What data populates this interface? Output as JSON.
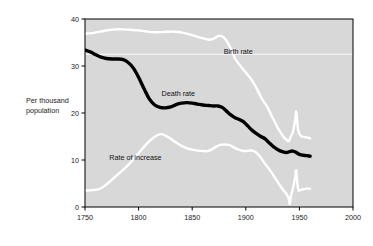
{
  "chart_data": {
    "type": "line",
    "title": "",
    "xlabel": "",
    "ylabel": "Per thousand population",
    "ylabel_line1": "Per thousand",
    "ylabel_line2": "population",
    "xlim": [
      1750,
      2000
    ],
    "ylim": [
      0,
      40
    ],
    "xticks": [
      1750,
      1800,
      1850,
      1900,
      1950,
      2000
    ],
    "yticks": [
      0,
      10,
      20,
      30,
      40
    ],
    "xtick_labels": [
      "1750",
      "1800",
      "1850",
      "1900",
      "1950",
      "2000"
    ],
    "ytick_labels": [
      "0",
      "10",
      "20",
      "30",
      "40"
    ],
    "grid": false,
    "gridlines_y": [
      32.5
    ],
    "legend_position": "inline-annotations",
    "plot_background": "#d8d8d8",
    "series": [
      {
        "name": "Birth rate",
        "color": "#ffffff",
        "label_x": 1893,
        "label_y": 32.6,
        "points": [
          [
            1750,
            36.9
          ],
          [
            1757,
            37.0
          ],
          [
            1764,
            37.3
          ],
          [
            1771,
            37.6
          ],
          [
            1778,
            37.8
          ],
          [
            1785,
            37.8
          ],
          [
            1792,
            37.7
          ],
          [
            1799,
            37.6
          ],
          [
            1806,
            37.4
          ],
          [
            1813,
            37.2
          ],
          [
            1820,
            37.2
          ],
          [
            1827,
            37.3
          ],
          [
            1834,
            37.3
          ],
          [
            1841,
            37.1
          ],
          [
            1848,
            36.7
          ],
          [
            1855,
            36.2
          ],
          [
            1862,
            35.8
          ],
          [
            1866,
            35.6
          ],
          [
            1869,
            35.7
          ],
          [
            1872,
            36.1
          ],
          [
            1875,
            36.4
          ],
          [
            1878,
            36.3
          ],
          [
            1881,
            35.7
          ],
          [
            1884,
            34.6
          ],
          [
            1887,
            33.2
          ],
          [
            1890,
            31.6
          ],
          [
            1895,
            30.0
          ],
          [
            1900,
            28.6
          ],
          [
            1905,
            27.2
          ],
          [
            1910,
            25.3
          ],
          [
            1915,
            23.0
          ],
          [
            1920,
            21.3
          ],
          [
            1925,
            19.0
          ],
          [
            1930,
            16.8
          ],
          [
            1935,
            15.0
          ],
          [
            1938,
            14.3
          ],
          [
            1940,
            14.0
          ],
          [
            1942,
            15.0
          ],
          [
            1944,
            16.0
          ],
          [
            1946,
            18.5
          ],
          [
            1947,
            20.3
          ],
          [
            1948,
            18.0
          ],
          [
            1949,
            16.2
          ],
          [
            1951,
            15.2
          ],
          [
            1954,
            14.9
          ],
          [
            1957,
            14.8
          ],
          [
            1960,
            14.6
          ]
        ]
      },
      {
        "name": "Death rate",
        "color": "#000000",
        "label_x": 1837,
        "label_y": 23.6,
        "points": [
          [
            1750,
            33.4
          ],
          [
            1755,
            33.0
          ],
          [
            1760,
            32.4
          ],
          [
            1765,
            31.9
          ],
          [
            1770,
            31.6
          ],
          [
            1775,
            31.5
          ],
          [
            1780,
            31.5
          ],
          [
            1785,
            31.4
          ],
          [
            1790,
            30.8
          ],
          [
            1795,
            29.6
          ],
          [
            1800,
            27.6
          ],
          [
            1805,
            25.2
          ],
          [
            1810,
            23.0
          ],
          [
            1815,
            21.7
          ],
          [
            1820,
            21.2
          ],
          [
            1825,
            21.1
          ],
          [
            1830,
            21.3
          ],
          [
            1835,
            21.8
          ],
          [
            1840,
            22.1
          ],
          [
            1845,
            22.2
          ],
          [
            1850,
            22.1
          ],
          [
            1855,
            21.9
          ],
          [
            1860,
            21.7
          ],
          [
            1865,
            21.6
          ],
          [
            1870,
            21.5
          ],
          [
            1874,
            21.5
          ],
          [
            1878,
            21.2
          ],
          [
            1882,
            20.4
          ],
          [
            1886,
            19.6
          ],
          [
            1890,
            19.0
          ],
          [
            1894,
            18.6
          ],
          [
            1898,
            18.1
          ],
          [
            1902,
            17.2
          ],
          [
            1906,
            16.3
          ],
          [
            1910,
            15.6
          ],
          [
            1914,
            15.0
          ],
          [
            1918,
            14.5
          ],
          [
            1922,
            13.6
          ],
          [
            1926,
            12.8
          ],
          [
            1930,
            12.2
          ],
          [
            1934,
            11.8
          ],
          [
            1938,
            11.6
          ],
          [
            1941,
            11.8
          ],
          [
            1944,
            11.9
          ],
          [
            1947,
            11.6
          ],
          [
            1950,
            11.2
          ],
          [
            1954,
            11.0
          ],
          [
            1958,
            10.9
          ],
          [
            1960,
            10.8
          ]
        ]
      },
      {
        "name": "Rate of increase",
        "color": "#ffffff",
        "label_x": 1797,
        "label_y": 9.9,
        "points": [
          [
            1750,
            3.5
          ],
          [
            1757,
            3.6
          ],
          [
            1763,
            3.8
          ],
          [
            1769,
            4.6
          ],
          [
            1775,
            5.8
          ],
          [
            1781,
            7.0
          ],
          [
            1787,
            8.2
          ],
          [
            1793,
            9.6
          ],
          [
            1799,
            11.2
          ],
          [
            1805,
            12.8
          ],
          [
            1811,
            14.2
          ],
          [
            1817,
            15.2
          ],
          [
            1821,
            15.5
          ],
          [
            1825,
            15.2
          ],
          [
            1830,
            14.5
          ],
          [
            1835,
            13.7
          ],
          [
            1840,
            13.0
          ],
          [
            1845,
            12.5
          ],
          [
            1850,
            12.2
          ],
          [
            1855,
            12.0
          ],
          [
            1860,
            11.9
          ],
          [
            1864,
            11.9
          ],
          [
            1868,
            12.2
          ],
          [
            1872,
            12.8
          ],
          [
            1876,
            13.2
          ],
          [
            1880,
            13.3
          ],
          [
            1884,
            13.2
          ],
          [
            1888,
            12.8
          ],
          [
            1892,
            12.3
          ],
          [
            1896,
            12.0
          ],
          [
            1900,
            11.9
          ],
          [
            1903,
            12.0
          ],
          [
            1906,
            12.0
          ],
          [
            1909,
            11.7
          ],
          [
            1913,
            10.8
          ],
          [
            1917,
            9.5
          ],
          [
            1921,
            8.3
          ],
          [
            1925,
            7.0
          ],
          [
            1929,
            5.6
          ],
          [
            1933,
            4.2
          ],
          [
            1936,
            3.3
          ],
          [
            1938,
            2.8
          ],
          [
            1940,
            1.8
          ],
          [
            1941,
            0.6
          ],
          [
            1942,
            2.2
          ],
          [
            1944,
            4.0
          ],
          [
            1946,
            6.3
          ],
          [
            1947,
            7.8
          ],
          [
            1948,
            5.3
          ],
          [
            1949,
            3.6
          ],
          [
            1951,
            3.6
          ],
          [
            1954,
            3.8
          ],
          [
            1957,
            3.9
          ],
          [
            1960,
            3.9
          ]
        ]
      }
    ]
  },
  "annotations": {
    "birth_rate_label": "Birth rate",
    "death_rate_label": "Death rate",
    "rate_of_increase_label": "Rate of increase"
  }
}
